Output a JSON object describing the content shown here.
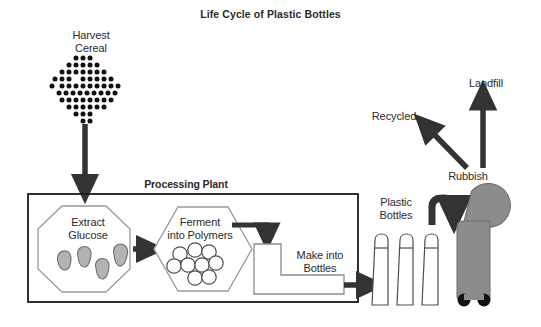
{
  "title": "Life Cycle of Plastic Bottles",
  "nodes": {
    "harvest": "Harvest\nCereal",
    "processing_plant": "Processing Plant",
    "extract": "Extract\nGlucose",
    "ferment": "Ferment\ninto Polymers",
    "make_bottles": "Make into\nBottles",
    "plastic_bottles": "Plastic\nBottles",
    "rubbish": "Rubbish",
    "recycled": "Recycled",
    "landfill": "Landfill"
  },
  "colors": {
    "ink": "#2b2b2b",
    "stroke_dark": "#333333",
    "stroke_light": "#808080",
    "fill_gray": "#a6a6a6",
    "fill_white": "#ffffff",
    "background": "#ffffff"
  },
  "shapes": {
    "cereal_dot_count": 61,
    "glucose_blob_count": 4,
    "polymer_circle_count": 9,
    "bottle_count": 3,
    "bin_wheel_count": 2
  },
  "flow": [
    {
      "from": "harvest",
      "to": "processing_plant",
      "style": "straight-down-arrow"
    },
    {
      "from": "extract",
      "to": "ferment",
      "style": "straight-right-arrow"
    },
    {
      "from": "ferment",
      "to": "make_bottles",
      "style": "elbow-right-down-arrow"
    },
    {
      "from": "make_bottles",
      "to": "plastic_bottles",
      "style": "straight-right-arrow"
    },
    {
      "from": "plastic_bottles",
      "to": "rubbish",
      "style": "curved-right-down-arrow"
    },
    {
      "from": "rubbish",
      "to": "recycled",
      "style": "diagonal-up-left-arrow"
    },
    {
      "from": "rubbish",
      "to": "landfill",
      "style": "straight-up-arrow"
    }
  ]
}
